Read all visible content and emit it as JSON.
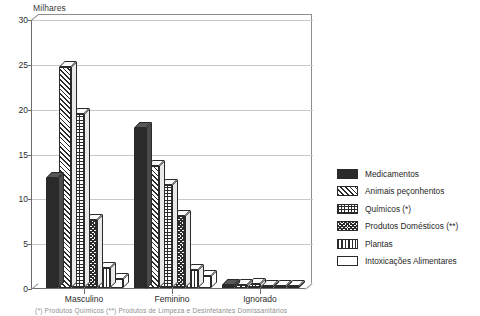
{
  "chart_data": {
    "type": "bar",
    "title": "",
    "ylabel": "Milhares",
    "xlabel": "",
    "ylim": [
      0,
      30
    ],
    "yticks": [
      0,
      5,
      10,
      15,
      20,
      25,
      30
    ],
    "grid": true,
    "legend_position": "right",
    "categories": [
      "Masculino",
      "Feminino",
      "Ignorado"
    ],
    "series": [
      {
        "name": "Medicamentos",
        "pattern": "solid",
        "values": [
          12.3,
          17.9,
          0.35
        ]
      },
      {
        "name": "Animais peçonhentos",
        "pattern": "diag",
        "values": [
          24.6,
          13.6,
          0.3
        ]
      },
      {
        "name": "Químicos (*)",
        "pattern": "grid",
        "values": [
          19.4,
          11.5,
          0.45
        ]
      },
      {
        "name": "Produtos Domésticos (**)",
        "pattern": "check",
        "values": [
          7.6,
          8.0,
          0.2
        ]
      },
      {
        "name": "Plantas",
        "pattern": "vert",
        "values": [
          2.2,
          2.0,
          0.1
        ]
      },
      {
        "name": "Intoxicações Alimentares",
        "pattern": "empty",
        "values": [
          1.0,
          1.3,
          0.08
        ]
      }
    ]
  },
  "axis": {
    "ylabel_text": "Milhares",
    "tick_labels": [
      "30",
      "25",
      "20",
      "15",
      "10",
      "5",
      "0"
    ]
  },
  "legend": {
    "items": [
      {
        "label": "Medicamentos"
      },
      {
        "label": "Animais peçonhentos"
      },
      {
        "label": "Químicos (*)"
      },
      {
        "label": "Produtos Domésticos (**)"
      },
      {
        "label": "Plantas"
      },
      {
        "label": "Intoxicações Alimentares"
      }
    ]
  },
  "footnote": {
    "text": "(*) Produtos Químicos   (**) Produtos de Limpeza e Desinfetantes Domissanitários"
  },
  "colors": {
    "ink": "#2a2a2a",
    "axis": "#6b6b6b",
    "grid": "#c9c9c9",
    "background": "#ffffff"
  }
}
